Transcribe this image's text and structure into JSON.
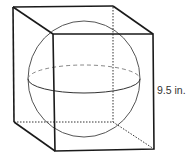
{
  "diagram": {
    "type": "sphere-inscribed-in-cube",
    "dimension_label": "9.5 in.",
    "colors": {
      "edge": "#1a1a1a",
      "hidden_edge": "#333333",
      "sphere": "#555555",
      "equator_hidden": "#888888",
      "label": "#333333",
      "background": "#ffffff"
    }
  }
}
